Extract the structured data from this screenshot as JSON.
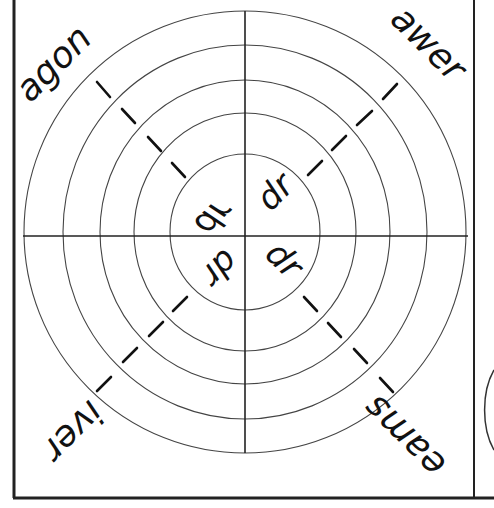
{
  "worksheet": {
    "title": "Word wheel: dr",
    "center_blend": "dr",
    "center_labels": [
      {
        "quadrant": "top-left",
        "text": "dr",
        "rotation": -45
      },
      {
        "quadrant": "top-right",
        "text": "dr",
        "rotation": -45
      },
      {
        "quadrant": "bottom-right",
        "text": "dr",
        "rotation": 45
      },
      {
        "quadrant": "bottom-left",
        "text": "dr",
        "rotation": 135
      }
    ],
    "endings": [
      {
        "quadrant": "top-left",
        "text": "agon",
        "rotation": -45
      },
      {
        "quadrant": "top-right",
        "text": "awer",
        "rotation": 45
      },
      {
        "quadrant": "bottom-right",
        "text": "eams",
        "rotation": -135
      },
      {
        "quadrant": "bottom-left",
        "text": "iver",
        "rotation": 135
      }
    ],
    "rings": 5,
    "colors": {
      "line": "#222222",
      "ring": "#444444",
      "text": "#111111",
      "background": "#ffffff"
    }
  }
}
